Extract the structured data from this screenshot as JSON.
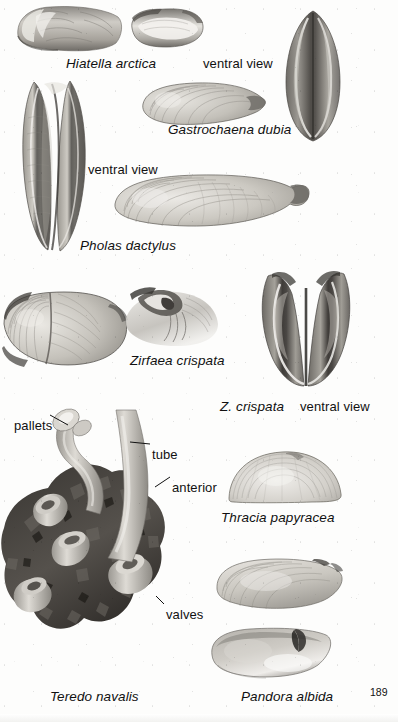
{
  "page": {
    "kind": "field-guide-plate",
    "page_number": "189",
    "background_color": "#fdfdfc",
    "text_color": "#111111",
    "width": 398,
    "height": 722
  },
  "labels": [
    {
      "id": "hiatella-arctica",
      "text": "Hiatella arctica",
      "style": "scientific",
      "x": 66,
      "y": 57
    },
    {
      "id": "ventral-view-top",
      "text": "ventral view",
      "style": "anatomical",
      "x": 203,
      "y": 57
    },
    {
      "id": "gastrochaena-dubia",
      "text": "Gastrochaena dubia",
      "style": "scientific",
      "x": 168,
      "y": 123
    },
    {
      "id": "ventral-view-pholas",
      "text": "ventral view",
      "style": "anatomical",
      "x": 88,
      "y": 163
    },
    {
      "id": "pholas-dactylus",
      "text": "Pholas dactylus",
      "style": "scientific",
      "x": 80,
      "y": 239
    },
    {
      "id": "zirfaea-crispata",
      "text": "Zirfaea crispata",
      "style": "scientific",
      "x": 130,
      "y": 354
    },
    {
      "id": "z-crispata",
      "text": "Z. crispata",
      "style": "scientific",
      "x": 220,
      "y": 400
    },
    {
      "id": "ventral-view-zirfaea",
      "text": "ventral view",
      "style": "anatomical",
      "x": 300,
      "y": 400
    },
    {
      "id": "pallets",
      "text": "pallets",
      "style": "anatomical",
      "x": 14,
      "y": 419
    },
    {
      "id": "tube",
      "text": "tube",
      "style": "anatomical",
      "x": 152,
      "y": 448
    },
    {
      "id": "anterior",
      "text": "anterior",
      "style": "anatomical",
      "x": 172,
      "y": 481
    },
    {
      "id": "thracia-papyracea",
      "text": "Thracia papyracea",
      "style": "scientific",
      "x": 221,
      "y": 511
    },
    {
      "id": "valves",
      "text": "valves",
      "style": "anatomical",
      "x": 166,
      "y": 608
    },
    {
      "id": "teredo-navalis",
      "text": "Teredo navalis",
      "style": "scientific",
      "x": 50,
      "y": 690
    },
    {
      "id": "pandora-albida",
      "text": "Pandora albida",
      "style": "scientific",
      "x": 241,
      "y": 690
    }
  ],
  "specimens": [
    {
      "id": "hiatella-arctica-lateral",
      "name": "Hiatella arctica lateral valve photograph",
      "x": 12,
      "y": 2,
      "w": 112,
      "h": 52
    },
    {
      "id": "hiatella-arctica-ventral",
      "name": "Hiatella arctica ventral view photograph",
      "x": 128,
      "y": 6,
      "w": 78,
      "h": 44
    },
    {
      "id": "gastrochaena-dubia-ventral",
      "name": "Gastrochaena dubia ventral view photograph",
      "x": 282,
      "y": 10,
      "w": 62,
      "h": 132
    },
    {
      "id": "gastrochaena-dubia-lateral",
      "name": "Gastrochaena dubia lateral valve photograph",
      "x": 140,
      "y": 80,
      "w": 128,
      "h": 48
    },
    {
      "id": "pholas-dactylus-ventral",
      "name": "Pholas dactylus ventral view photograph",
      "x": 18,
      "y": 78,
      "w": 74,
      "h": 176
    },
    {
      "id": "pholas-dactylus-lateral",
      "name": "Pholas dactylus lateral valve photograph",
      "x": 112,
      "y": 172,
      "w": 200,
      "h": 58
    },
    {
      "id": "zirfaea-crispata-lateral",
      "name": "Zirfaea crispata lateral valve photograph",
      "x": 2,
      "y": 288,
      "w": 128,
      "h": 82
    },
    {
      "id": "zirfaea-crispata-hinge",
      "name": "Zirfaea crispata hinge detail photograph",
      "x": 118,
      "y": 284,
      "w": 104,
      "h": 66
    },
    {
      "id": "zirfaea-crispata-ventral",
      "name": "Zirfaea crispata ventral view photograph",
      "x": 258,
      "y": 270,
      "w": 96,
      "h": 118
    },
    {
      "id": "teredo-navalis-colony",
      "name": "Teredo navalis tubes in bored wood photograph",
      "x": 0,
      "y": 410,
      "w": 200,
      "h": 268
    },
    {
      "id": "thracia-papyracea-valve",
      "name": "Thracia papyracea valve photograph",
      "x": 226,
      "y": 448,
      "w": 118,
      "h": 56
    },
    {
      "id": "pandora-albida-valve-1",
      "name": "Pandora albida valve photograph upper",
      "x": 214,
      "y": 555,
      "w": 132,
      "h": 58
    },
    {
      "id": "pandora-albida-valve-2",
      "name": "Pandora albida valve photograph lower",
      "x": 208,
      "y": 625,
      "w": 128,
      "h": 56
    }
  ],
  "leaders": [
    {
      "id": "leader-pallets",
      "from_label": "pallets",
      "x1": 50,
      "y1": 415,
      "x2": 68,
      "y2": 425
    },
    {
      "id": "leader-tube",
      "from_label": "tube",
      "x1": 150,
      "y1": 444,
      "x2": 130,
      "y2": 442
    },
    {
      "id": "leader-anterior",
      "from_label": "anterior",
      "x1": 170,
      "y1": 477,
      "x2": 155,
      "y2": 487
    },
    {
      "id": "leader-valves",
      "from_label": "valves",
      "x1": 164,
      "y1": 604,
      "x2": 156,
      "y2": 596
    }
  ]
}
